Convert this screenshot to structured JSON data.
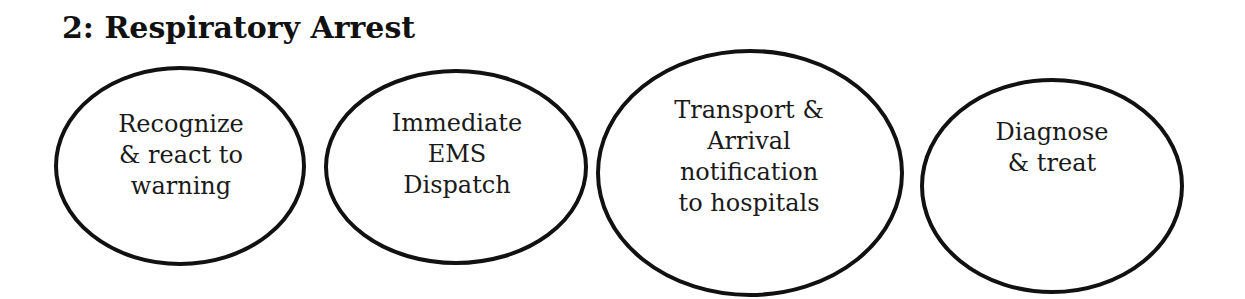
{
  "title": "2: Respiratory Arrest",
  "colors": {
    "stroke": "#111111",
    "text": "#1a1a1a",
    "background": "#ffffff"
  },
  "nodes": [
    {
      "lines": [
        "Recognize",
        "& react to",
        "warning"
      ]
    },
    {
      "lines": [
        "Immediate",
        "EMS",
        "Dispatch"
      ]
    },
    {
      "lines": [
        "Transport &",
        "Arrival",
        "notification",
        "to hospitals"
      ]
    },
    {
      "lines": [
        "Diagnose",
        "& treat"
      ]
    }
  ]
}
